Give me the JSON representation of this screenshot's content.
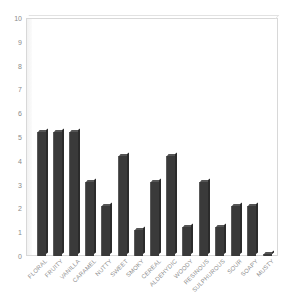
{
  "chart_data": {
    "type": "bar",
    "title": "",
    "xlabel": "",
    "ylabel": "",
    "ylim": [
      0,
      10
    ],
    "grid": false,
    "legend": "none",
    "bar_color": "#3a3a3a",
    "plot_background": "#ffffff",
    "frame_color": "#d8d8d8",
    "tick_label_color": "#8a8a8a",
    "yticks": [
      "0",
      "1",
      "2",
      "3",
      "4",
      "5",
      "6",
      "7",
      "8",
      "9",
      "10"
    ],
    "categories": [
      "FLORAL",
      "FRUITY",
      "VANILLA",
      "CARAMEL",
      "NUTTY",
      "SWEET",
      "SMOKY",
      "CEREAL",
      "ALDEHYDIC",
      "WOODY",
      "RESINOUS",
      "SULPHUROUS",
      "SOUR",
      "SOAPY",
      "MUSTY"
    ],
    "values": [
      5.2,
      5.2,
      5.2,
      3.1,
      2.1,
      4.2,
      1.1,
      3.1,
      4.2,
      1.2,
      3.1,
      1.2,
      2.1,
      2.1,
      0.1
    ]
  }
}
